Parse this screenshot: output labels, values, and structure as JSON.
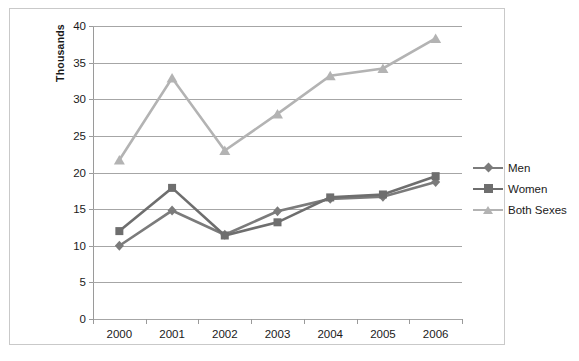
{
  "chart_data": {
    "type": "line",
    "title": "",
    "xlabel": "",
    "ylabel": "Thousands",
    "categories": [
      "2000",
      "2001",
      "2002",
      "2003",
      "2004",
      "2005",
      "2006"
    ],
    "x": [
      2000,
      2001,
      2002,
      2003,
      2004,
      2005,
      2006
    ],
    "ylim": [
      0,
      40
    ],
    "ytick_step": 5,
    "yticks": [
      0,
      5,
      10,
      15,
      20,
      25,
      30,
      35,
      40
    ],
    "ytick_labels": [
      "0",
      "5",
      "10",
      "15",
      "20",
      "25",
      "30",
      "35",
      "40"
    ],
    "grid": "horizontal",
    "legend_position": "right",
    "series": [
      {
        "name": "Men",
        "marker": "diamond",
        "color": "#7b7b7b",
        "values": [
          10.0,
          14.8,
          11.5,
          14.7,
          16.4,
          16.7,
          18.7
        ]
      },
      {
        "name": "Women",
        "marker": "square",
        "color": "#6e6e6e",
        "values": [
          12.0,
          17.9,
          11.4,
          13.2,
          16.6,
          17.0,
          19.5
        ]
      },
      {
        "name": "Both Sexes",
        "marker": "triangle",
        "color": "#b3b3b3",
        "values": [
          21.7,
          32.9,
          23.0,
          28.0,
          33.2,
          34.2,
          38.3
        ]
      }
    ]
  },
  "axis": {
    "y_title": "Thousands"
  },
  "legend": {
    "items": [
      {
        "label": "Men"
      },
      {
        "label": "Women"
      },
      {
        "label": "Both Sexes"
      }
    ]
  },
  "colors": {
    "men": "#7b7b7b",
    "women": "#6e6e6e",
    "both_sexes": "#b3b3b3",
    "gridline": "#a6a6a6",
    "axis": "#9a9a9a",
    "border": "#c9c9c9",
    "text": "#1a1a1a",
    "background": "#ffffff"
  }
}
